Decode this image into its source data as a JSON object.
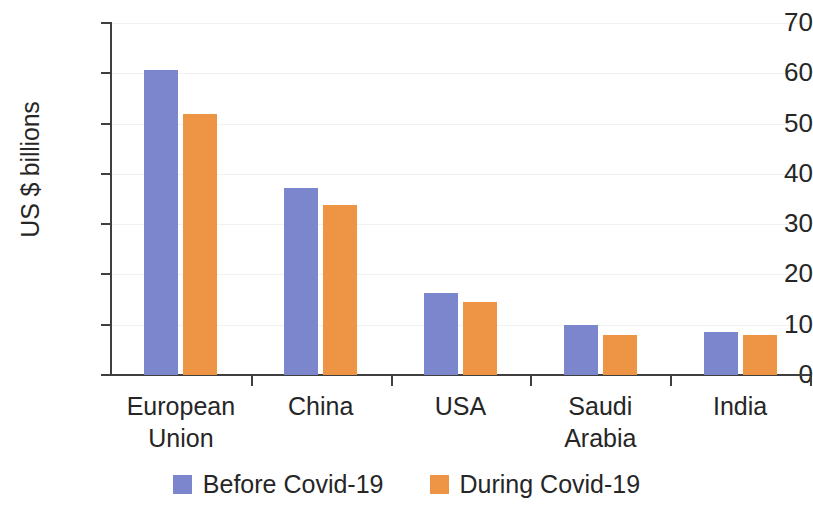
{
  "chart_data": {
    "type": "bar",
    "title": "",
    "xlabel": "",
    "ylabel": "US $ billions",
    "ylim": [
      0,
      70
    ],
    "ytick_values": [
      70,
      60,
      50,
      40,
      30,
      20,
      10,
      0
    ],
    "ytick_labels": [
      "70",
      "60",
      "50",
      "40",
      "30",
      "20",
      "10",
      "0"
    ],
    "grid": true,
    "grid_axis": "y",
    "legend_position": "bottom",
    "categories": [
      "European Union",
      "China",
      "USA",
      "Saudi Arabia",
      "India"
    ],
    "category_lines": [
      [
        "European",
        "Union"
      ],
      [
        "China"
      ],
      [
        "USA"
      ],
      [
        "Saudi",
        "Arabia"
      ],
      [
        "India"
      ]
    ],
    "series": [
      {
        "name": "Before Covid-19",
        "color": "#7b86cc",
        "values": [
          60.6,
          37.2,
          16.3,
          10.0,
          8.5
        ]
      },
      {
        "name": "During Covid-19",
        "color": "#ed9544",
        "values": [
          51.9,
          33.8,
          14.5,
          8.0,
          7.9
        ]
      }
    ]
  },
  "colors": {
    "before": "#7b86cc",
    "during": "#ed9544",
    "axis": "#3f3f3f",
    "gridline": "#f1f1f1",
    "text": "#262626",
    "background": "#ffffff"
  }
}
